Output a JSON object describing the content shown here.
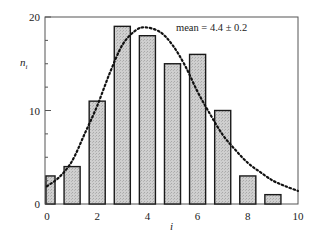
{
  "chart_data": {
    "type": "bar",
    "title": "",
    "xlabel": "i",
    "ylabel": "n_i",
    "xlim": [
      0,
      10
    ],
    "ylim": [
      0,
      20
    ],
    "x_ticks": [
      "0",
      "2",
      "4",
      "6",
      "8",
      "10"
    ],
    "y_ticks": [
      "0",
      "10",
      "20"
    ],
    "grid": false,
    "legend": null,
    "categories": [
      0,
      1,
      2,
      3,
      4,
      5,
      6,
      7,
      8,
      9
    ],
    "values": [
      3,
      4,
      11,
      19,
      18,
      15,
      16,
      10,
      3,
      1
    ],
    "series": [
      {
        "name": "histogram n_i",
        "type": "bar",
        "x": [
          0,
          1,
          2,
          3,
          4,
          5,
          6,
          7,
          8,
          9
        ],
        "values": [
          3,
          4,
          11,
          19,
          18,
          15,
          16,
          10,
          3,
          1
        ]
      },
      {
        "name": "fitted distribution",
        "type": "line",
        "style": "dotted",
        "x": [
          0,
          0.5,
          1,
          1.5,
          2,
          2.5,
          3,
          3.5,
          3.9,
          4.5,
          5,
          5.5,
          6,
          6.5,
          7,
          7.5,
          8,
          8.5,
          9,
          9.5,
          10
        ],
        "values": [
          1.9,
          2.9,
          4.6,
          7.5,
          10.5,
          14,
          17,
          18.5,
          18.9,
          18.4,
          17,
          14.8,
          12,
          9.6,
          7.4,
          5.8,
          4.4,
          3.4,
          2.5,
          1.9,
          1.4
        ]
      }
    ],
    "annotations": [
      "mean = 4.4 ± 0.2"
    ]
  },
  "labels": {
    "xlabel": "i",
    "ylabel_main": "n",
    "ylabel_sub": "i",
    "annotation": "mean = 4.4 ± 0.2",
    "x_ticks": [
      "0",
      "2",
      "4",
      "6",
      "8",
      "10"
    ],
    "y_ticks": [
      "0",
      "10",
      "20"
    ]
  },
  "colors": {
    "bar_fill": "#c8c8c8",
    "bar_stroke": "#1a1a1a",
    "curve": "#111111",
    "axis": "#555555"
  }
}
